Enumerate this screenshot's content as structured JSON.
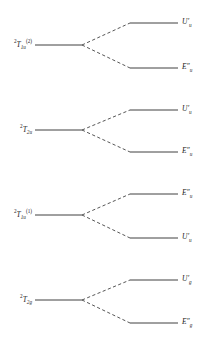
{
  "diagram": {
    "type": "energy-level-correlation",
    "line_color": "#2b2b2b",
    "background_color": "#ffffff",
    "groups": [
      {
        "parent": {
          "symbol": "T",
          "pre_superscript": "2",
          "subscript": "1u",
          "superscript": "(2)",
          "text": "2T1u(2)",
          "y": 45,
          "x_start": 35,
          "x_end": 82
        },
        "children": [
          {
            "symbol": "U",
            "primes": "′",
            "subscript": "u",
            "text": "U′u",
            "y": 23,
            "x_start": 130,
            "x_end": 178,
            "position": "upper"
          },
          {
            "symbol": "E",
            "primes": "″",
            "subscript": "u",
            "text": "E″u",
            "y": 68,
            "x_start": 130,
            "x_end": 178,
            "position": "lower"
          }
        ]
      },
      {
        "parent": {
          "symbol": "T",
          "pre_superscript": "2",
          "subscript": "2u",
          "superscript": "",
          "text": "2T2u",
          "y": 130,
          "x_start": 35,
          "x_end": 82
        },
        "children": [
          {
            "symbol": "U",
            "primes": "′",
            "subscript": "u",
            "text": "U′u",
            "y": 110,
            "x_start": 130,
            "x_end": 178,
            "position": "upper"
          },
          {
            "symbol": "E",
            "primes": "″",
            "subscript": "u",
            "text": "E″u",
            "y": 152,
            "x_start": 130,
            "x_end": 178,
            "position": "lower"
          }
        ]
      },
      {
        "parent": {
          "symbol": "T",
          "pre_superscript": "2",
          "subscript": "1u",
          "superscript": "(1)",
          "text": "2T1u(1)",
          "y": 215,
          "x_start": 35,
          "x_end": 82
        },
        "children": [
          {
            "symbol": "E",
            "primes": "″",
            "subscript": "u",
            "text": "E″u",
            "y": 194,
            "x_start": 130,
            "x_end": 178,
            "position": "upper"
          },
          {
            "symbol": "U",
            "primes": "′",
            "subscript": "u",
            "text": "U′u",
            "y": 238,
            "x_start": 130,
            "x_end": 178,
            "position": "lower"
          }
        ]
      },
      {
        "parent": {
          "symbol": "T",
          "pre_superscript": "2",
          "subscript": "2g",
          "superscript": "",
          "text": "2T2g",
          "y": 300,
          "x_start": 35,
          "x_end": 82
        },
        "children": [
          {
            "symbol": "U",
            "primes": "′",
            "subscript": "g",
            "text": "U′g",
            "y": 280,
            "x_start": 130,
            "x_end": 178,
            "position": "upper"
          },
          {
            "symbol": "E",
            "primes": "″",
            "subscript": "g",
            "text": "E″g",
            "y": 323,
            "x_start": 130,
            "x_end": 178,
            "position": "lower"
          }
        ]
      }
    ]
  }
}
